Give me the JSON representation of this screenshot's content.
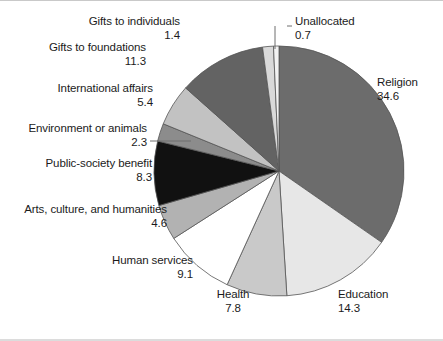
{
  "chart_data": {
    "type": "pie",
    "title": "",
    "subtitle": "",
    "xlabel": "",
    "ylabel": "",
    "legend_position": "none",
    "grid": false,
    "units": "percent",
    "start_angle_deg": 0,
    "direction": "clockwise",
    "categories": [
      "Religion",
      "Education",
      "Health",
      "Human services",
      "Arts, culture, and humanities",
      "Public-society benefit",
      "Environment or animals",
      "International affairs",
      "Gifts to foundations",
      "Gifts to individuals",
      "Unallocated"
    ],
    "values": [
      34.6,
      14.3,
      7.8,
      9.1,
      4.6,
      8.3,
      2.3,
      5.4,
      11.3,
      1.4,
      0.7
    ],
    "value_labels": [
      "34.6",
      "14.3",
      "7.8",
      "9.1",
      "4.6",
      "8.3",
      "2.3",
      "5.4",
      "11.3",
      "1.4",
      "0.7"
    ],
    "slice_colors": [
      "#6c6c6c",
      "#e7e7e7",
      "#c9c9c9",
      "#ffffff",
      "#b2b2b2",
      "#111111",
      "#8c8c8c",
      "#c2c2c2",
      "#636363",
      "#d9d9d9",
      "#f2f2f2"
    ],
    "slice_outline_color": "#555555",
    "leader_line_color": "#6e6e6e",
    "background_color": "#ffffff",
    "text_color": "#1b1b1b"
  },
  "slices": [
    {
      "name": "Religion",
      "value": "34.6"
    },
    {
      "name": "Education",
      "value": "14.3"
    },
    {
      "name": "Health",
      "value": "7.8"
    },
    {
      "name": "Human services",
      "value": "9.1"
    },
    {
      "name": "Arts, culture, and humanities",
      "value": "4.6"
    },
    {
      "name": "Public-society benefit",
      "value": "8.3"
    },
    {
      "name": "Environment or animals",
      "value": "2.3"
    },
    {
      "name": "International affairs",
      "value": "5.4"
    },
    {
      "name": "Gifts to foundations",
      "value": "11.3"
    },
    {
      "name": "Gifts to individuals",
      "value": "1.4"
    },
    {
      "name": "Unallocated",
      "value": "0.7"
    }
  ]
}
